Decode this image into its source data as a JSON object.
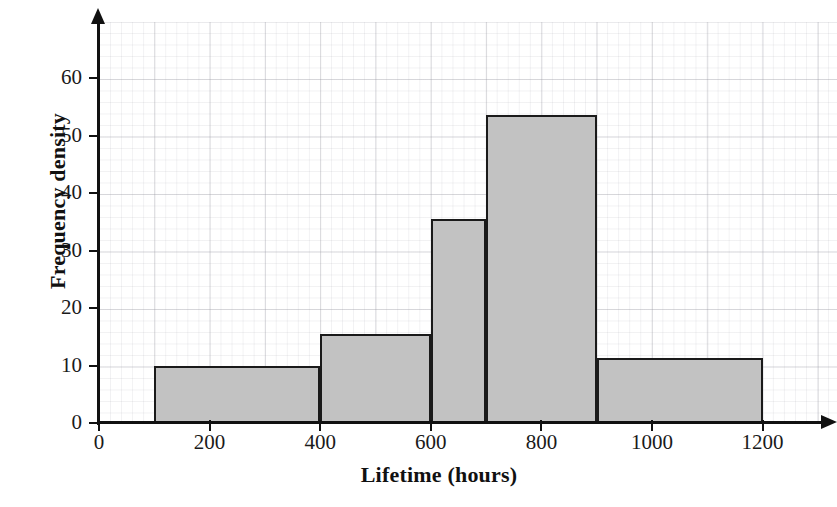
{
  "chart_data": {
    "type": "bar",
    "title": "",
    "xlabel": "Lifetime (hours)",
    "ylabel": "Frequency density",
    "grid": true,
    "legend": "none",
    "xlim": [
      0,
      1200
    ],
    "ylim": [
      0,
      65
    ],
    "xticks": [
      0,
      200,
      400,
      600,
      800,
      1000,
      1200
    ],
    "xtick_labels": [
      "0",
      "200",
      "400",
      "600",
      "800",
      "1000",
      "1200"
    ],
    "yticks": [
      0,
      10,
      20,
      30,
      40,
      50,
      60
    ],
    "ytick_labels": [
      "0",
      "10",
      "20",
      "30",
      "40",
      "50",
      "60"
    ],
    "bar_fill_color": "#c2c2c2",
    "bar_edge_color": "#1a1a1a",
    "bins": [
      {
        "x0": 100,
        "x1": 400,
        "value": 10.0,
        "label": "100-400"
      },
      {
        "x0": 400,
        "x1": 600,
        "value": 15.5,
        "label": "400-600"
      },
      {
        "x0": 600,
        "x1": 700,
        "value": 35.5,
        "label": "600-700"
      },
      {
        "x0": 700,
        "x1": 900,
        "value": 53.5,
        "label": "700-900"
      },
      {
        "x0": 900,
        "x1": 1200,
        "value": 11.3,
        "label": "900-1200"
      }
    ],
    "categories": [
      "100-400",
      "400-600",
      "600-700",
      "700-900",
      "900-1200"
    ],
    "values": [
      10.0,
      15.5,
      35.5,
      53.5,
      11.3
    ]
  }
}
